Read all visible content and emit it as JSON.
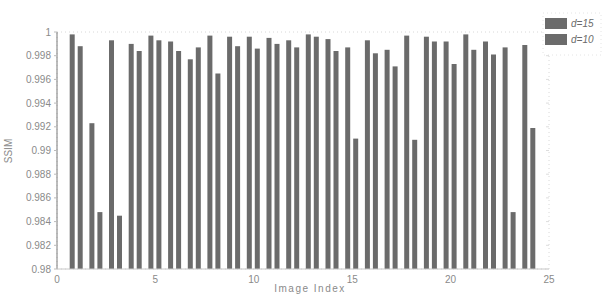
{
  "chart_data": {
    "type": "bar",
    "title": "",
    "xlabel": "Image Index",
    "ylabel": "SSIM",
    "xlim": [
      0,
      25
    ],
    "ylim": [
      0.98,
      1.0
    ],
    "x_ticks": [
      0,
      5,
      10,
      15,
      20,
      25
    ],
    "y_ticks": [
      0.98,
      0.982,
      0.984,
      0.986,
      0.988,
      0.99,
      0.992,
      0.994,
      0.996,
      0.998,
      1
    ],
    "y_tick_labels": [
      "0.98",
      "0.982",
      "0.984",
      "0.986",
      "0.988",
      "0.99",
      "0.992",
      "0.994",
      "0.996",
      "0.998",
      "1"
    ],
    "x_tick_labels": [
      "0",
      "5",
      "10",
      "15",
      "20",
      "25"
    ],
    "grid": false,
    "legend_position": "outside-right-top",
    "categories": [
      1,
      2,
      3,
      4,
      5,
      6,
      7,
      8,
      9,
      10,
      11,
      12,
      13,
      14,
      15,
      16,
      17,
      18,
      19,
      20,
      21,
      22,
      23,
      24
    ],
    "series": [
      {
        "name": "d=15",
        "color": "#6b6b6b",
        "values": [
          0.9998,
          0.9923,
          0.9993,
          0.999,
          0.9997,
          0.9992,
          0.9977,
          0.9997,
          0.9996,
          0.9996,
          0.9995,
          0.9993,
          0.9998,
          0.9994,
          0.9987,
          0.9993,
          0.9985,
          0.9997,
          0.9996,
          0.9992,
          0.9998,
          0.9992,
          0.9987,
          0.9989
        ]
      },
      {
        "name": "d=10",
        "color": "#6b6b6b",
        "values": [
          0.9988,
          0.9848,
          0.9845,
          0.9984,
          0.9993,
          0.9984,
          0.9987,
          0.9965,
          0.9988,
          0.9986,
          0.999,
          0.9987,
          0.9996,
          0.9984,
          0.991,
          0.9982,
          0.9971,
          0.9909,
          0.9992,
          0.9973,
          0.9985,
          0.9981,
          0.9848,
          0.9919
        ]
      }
    ]
  },
  "legend": {
    "items": [
      {
        "label": "d=15",
        "color": "#6b6b6b"
      },
      {
        "label": "d=10",
        "color": "#6b6b6b"
      }
    ]
  },
  "axes": {
    "xlabel": "Image Index",
    "ylabel": "SSIM"
  }
}
